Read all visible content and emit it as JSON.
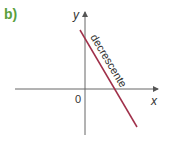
{
  "label": "b)",
  "axes": {
    "x_label": "x",
    "y_label": "y",
    "origin_label": "0"
  },
  "line": {
    "annotation": "decrescente",
    "color": "#a0304a"
  },
  "colors": {
    "label": "#5aa03c",
    "axis": "#555555"
  }
}
